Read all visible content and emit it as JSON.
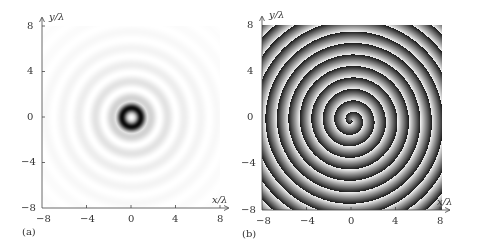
{
  "chart_data": [
    {
      "type": "heatmap",
      "panel_label": "(a)",
      "title": "",
      "xlabel": "x/λ",
      "ylabel": "y/λ",
      "xlim": [
        -8,
        8
      ],
      "ylim": [
        -8,
        8
      ],
      "x_ticks": [
        "−8",
        "−4",
        "0",
        "4",
        "8"
      ],
      "y_ticks": [
        "8",
        "4",
        "0",
        "−4",
        "−8"
      ],
      "description": "Intensity of a vortex beam: bright center spot surrounded by a dark ring (radius ~0.8λ) and faint concentric rings fading outward to ~7λ",
      "colormap": "grayscale (dark = high)",
      "grid": false
    },
    {
      "type": "heatmap",
      "panel_label": "(b)",
      "title": "",
      "xlabel": "x/λ",
      "ylabel": "y/λ",
      "xlim": [
        -8,
        8
      ],
      "ylim": [
        -8,
        8
      ],
      "x_ticks": [
        "−8",
        "−4",
        "0",
        "4",
        "8"
      ],
      "y_ticks": [
        "8",
        "4",
        "0",
        "−4",
        "−8"
      ],
      "description": "Phase distribution: single-armed spiral with ~8 turns wrapping out from center to the edges",
      "colormap": "grayscale (phase 0→2π)",
      "grid": false
    }
  ],
  "panels": {
    "a": {
      "label": "(a)",
      "xlabel": "x/λ",
      "ylabel": "y/λ",
      "ticks": [
        "−8",
        "−4",
        "0",
        "4",
        "8"
      ],
      "yticks": [
        "8",
        "4",
        "0",
        "−4",
        "−8"
      ]
    },
    "b": {
      "label": "(b)",
      "xlabel": "x/λ",
      "ylabel": "y/λ",
      "ticks": [
        "−8",
        "−4",
        "0",
        "4",
        "8"
      ],
      "yticks": [
        "8",
        "4",
        "0",
        "−4",
        "−8"
      ]
    }
  }
}
